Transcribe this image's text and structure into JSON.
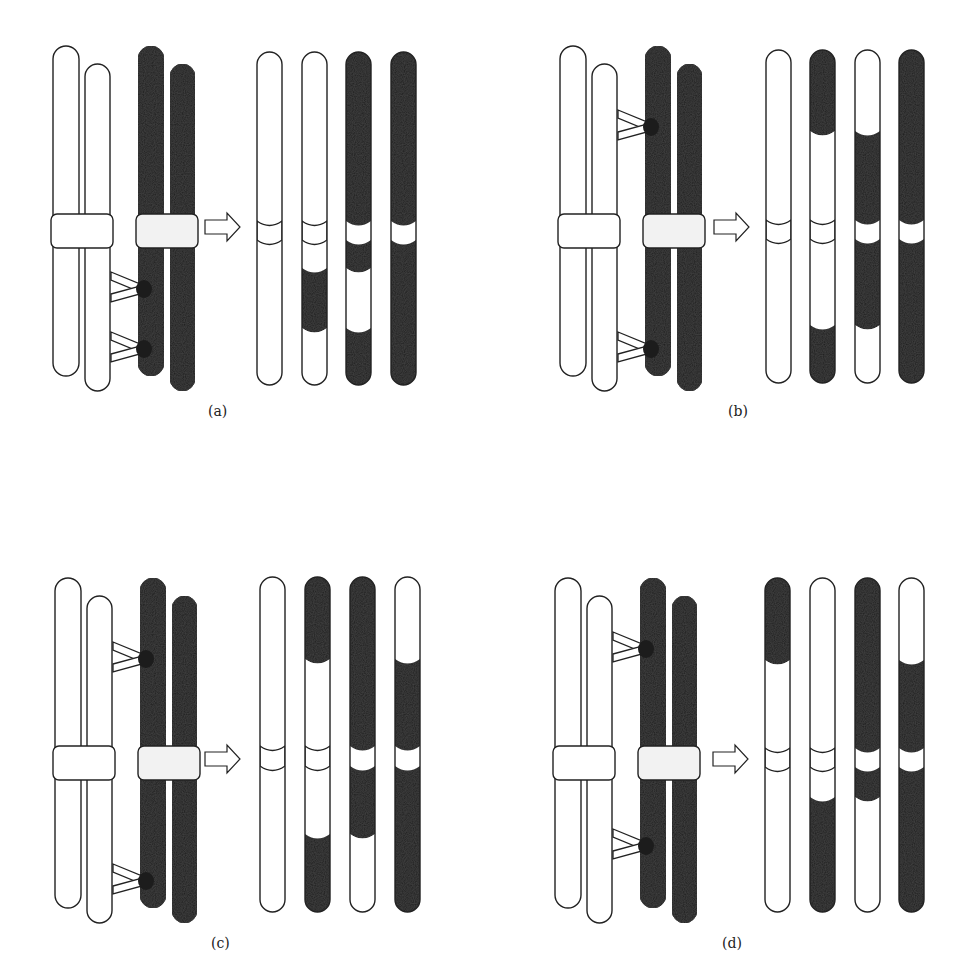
{
  "figure": {
    "colors": {
      "light": "#ffffff",
      "dark": "#1c1c1c",
      "outline": "#222222",
      "background": "#ffffff"
    },
    "panels": [
      {
        "id": "a",
        "label": "(a)",
        "label_pos": [
          208,
          403
        ],
        "tetrad_origin": [
          53,
          46
        ],
        "tetrad_variant": "two-strand-double",
        "arrow": [
          205,
          225
        ],
        "results": {
          "x": [
            257,
            302,
            346,
            391
          ],
          "top": 52,
          "bottom": 385,
          "width": 25,
          "centromere": [
            221,
            240
          ],
          "chromatids": [
            {
              "segments": [
                [
                  "w",
                  52,
                  385
                ]
              ],
              "centromere": "w"
            },
            {
              "segments": [
                [
                  "w",
                  52,
                  268
                ],
                [
                  "d",
                  268,
                  328
                ],
                [
                  "w",
                  328,
                  385
                ]
              ],
              "centromere": "w"
            },
            {
              "segments": [
                [
                  "d",
                  52,
                  268
                ],
                [
                  "w",
                  268,
                  328
                ],
                [
                  "d",
                  328,
                  385
                ]
              ],
              "centromere": "w"
            },
            {
              "segments": [
                [
                  "d",
                  52,
                  385
                ]
              ],
              "centromere": "w"
            }
          ]
        }
      },
      {
        "id": "b",
        "label": "(b)",
        "label_pos": [
          728,
          403
        ],
        "tetrad_origin": [
          560,
          46
        ],
        "tetrad_variant": "three-strand-a",
        "arrow": [
          714,
          225
        ],
        "results": {
          "x": [
            766,
            810,
            855,
            899
          ],
          "top": 50,
          "bottom": 383,
          "width": 25,
          "centromere": [
            220,
            239
          ],
          "chromatids": [
            {
              "segments": [
                [
                  "w",
                  50,
                  383
                ]
              ],
              "centromere": "w"
            },
            {
              "segments": [
                [
                  "d",
                  50,
                  131
                ],
                [
                  "w",
                  131,
                  325
                ],
                [
                  "d",
                  325,
                  383
                ]
              ],
              "centromere": "w"
            },
            {
              "segments": [
                [
                  "w",
                  50,
                  131
                ],
                [
                  "d",
                  131,
                  325
                ],
                [
                  "w",
                  325,
                  383
                ]
              ],
              "centromere": "w"
            },
            {
              "segments": [
                [
                  "d",
                  50,
                  383
                ]
              ],
              "centromere": "w"
            }
          ]
        }
      },
      {
        "id": "c",
        "label": "(c)",
        "label_pos": [
          211,
          935
        ],
        "tetrad_origin": [
          55,
          578
        ],
        "tetrad_variant": "three-strand-b",
        "arrow": [
          205,
          757
        ],
        "results": {
          "x": [
            260,
            305,
            350,
            395
          ],
          "top": 577,
          "bottom": 912,
          "width": 25,
          "centromere": [
            746,
            766
          ],
          "chromatids": [
            {
              "segments": [
                [
                  "w",
                  577,
                  912
                ]
              ],
              "centromere": "w"
            },
            {
              "segments": [
                [
                  "d",
                  577,
                  659
                ],
                [
                  "w",
                  659,
                  834
                ],
                [
                  "d",
                  834,
                  912
                ]
              ],
              "centromere": "w"
            },
            {
              "segments": [
                [
                  "d",
                  577,
                  834
                ],
                [
                  "w",
                  834,
                  912
                ]
              ],
              "centromere": "w"
            },
            {
              "segments": [
                [
                  "w",
                  577,
                  659
                ],
                [
                  "d",
                  659,
                  912
                ]
              ],
              "centromere": "w"
            }
          ]
        }
      },
      {
        "id": "d",
        "label": "(d)",
        "label_pos": [
          722,
          935
        ],
        "tetrad_origin": [
          555,
          578
        ],
        "tetrad_variant": "four-strand",
        "arrow": [
          713,
          757
        ],
        "results": {
          "x": [
            765,
            810,
            855,
            899
          ],
          "top": 578,
          "bottom": 912,
          "width": 25,
          "centromere": [
            748,
            767
          ],
          "chromatids": [
            {
              "segments": [
                [
                  "d",
                  578,
                  660
                ],
                [
                  "w",
                  660,
                  912
                ]
              ],
              "centromere": "w"
            },
            {
              "segments": [
                [
                  "w",
                  578,
                  797
                ],
                [
                  "d",
                  797,
                  912
                ]
              ],
              "centromere": "w"
            },
            {
              "segments": [
                [
                  "d",
                  578,
                  797
                ],
                [
                  "w",
                  797,
                  912
                ]
              ],
              "centromere": "w"
            },
            {
              "segments": [
                [
                  "w",
                  578,
                  660
                ],
                [
                  "d",
                  660,
                  912
                ]
              ],
              "centromere": "w"
            }
          ]
        }
      }
    ]
  }
}
